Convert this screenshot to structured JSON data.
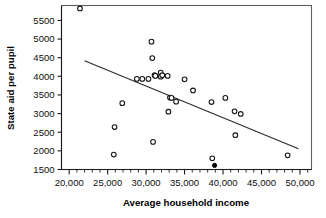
{
  "chart_data": {
    "type": "scatter",
    "title": "",
    "xlabel": "Average household income",
    "ylabel": "State aid per pupil",
    "xlim": [
      19000,
      51500
    ],
    "ylim": [
      1500,
      5900
    ],
    "xticks": [
      20000,
      25000,
      30000,
      35000,
      40000,
      45000,
      50000
    ],
    "xtick_labels": [
      "20,000",
      "25,000",
      "30,000",
      "35,000",
      "40,000",
      "45,000",
      "50,000"
    ],
    "yticks": [
      1500,
      2000,
      2500,
      3000,
      3500,
      4000,
      4500,
      5000,
      5500
    ],
    "ytick_labels": [
      "1500",
      "2000",
      "2500",
      "3000",
      "3500",
      "4000",
      "4500",
      "5000",
      "5500"
    ],
    "x_minor_tick_step": 1000,
    "grid": false,
    "legend": null,
    "series": [
      {
        "name": "districts-open",
        "marker": "open-circle",
        "color": "#151515",
        "points": [
          [
            21400,
            5820
          ],
          [
            25800,
            1900
          ],
          [
            25900,
            2640
          ],
          [
            26900,
            3280
          ],
          [
            28800,
            3930
          ],
          [
            29500,
            3930
          ],
          [
            30300,
            3930
          ],
          [
            30700,
            4930
          ],
          [
            30800,
            4490
          ],
          [
            30900,
            2240
          ],
          [
            31100,
            4030
          ],
          [
            31200,
            4010
          ],
          [
            31900,
            4100
          ],
          [
            31900,
            3990
          ],
          [
            32100,
            4030
          ],
          [
            32800,
            4010
          ],
          [
            32900,
            3050
          ],
          [
            33100,
            3430
          ],
          [
            33300,
            3420
          ],
          [
            33900,
            3320
          ],
          [
            35000,
            3920
          ],
          [
            36100,
            3620
          ],
          [
            38500,
            3310
          ],
          [
            38600,
            1800
          ],
          [
            40300,
            3420
          ],
          [
            41500,
            3060
          ],
          [
            41600,
            2420
          ],
          [
            42300,
            2990
          ],
          [
            48400,
            1880
          ]
        ]
      },
      {
        "name": "highlighted-district-filled",
        "marker": "filled-circle",
        "color": "#000000",
        "points": [
          [
            38900,
            1610
          ]
        ]
      }
    ],
    "trendline": {
      "name": "least-squares-fit",
      "x_start": 22000,
      "y_start": 4420,
      "x_end": 49800,
      "y_end": 2055,
      "color": "#2b2b2b"
    }
  }
}
